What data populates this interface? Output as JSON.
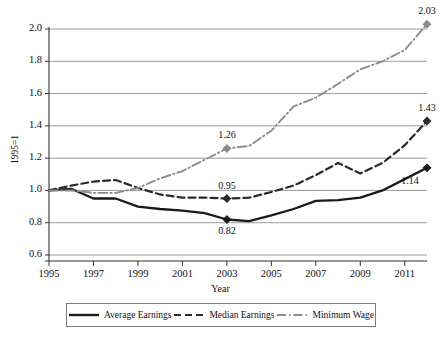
{
  "chart_data": {
    "type": "line",
    "title": "",
    "xlabel": "Year",
    "ylabel": "1995=1",
    "xlim": [
      1995,
      2012
    ],
    "ylim": [
      0.6,
      2.0
    ],
    "grid": true,
    "legend_position": "bottom",
    "x": [
      1995,
      1996,
      1997,
      1998,
      1999,
      2000,
      2001,
      2002,
      2003,
      2004,
      2005,
      2006,
      2007,
      2008,
      2009,
      2010,
      2011,
      2012
    ],
    "xtick_labels": [
      "1995",
      "1997",
      "1999",
      "2001",
      "2003",
      "2005",
      "2007",
      "2009",
      "2011"
    ],
    "xtick_values": [
      1995,
      1997,
      1999,
      2001,
      2003,
      2005,
      2007,
      2009,
      2011
    ],
    "ytick_labels": [
      "0.6",
      "0.8",
      "1.0",
      "1.2",
      "1.4",
      "1.6",
      "1.8",
      "2.0"
    ],
    "ytick_values": [
      0.6,
      0.8,
      1.0,
      1.2,
      1.4,
      1.6,
      1.8,
      2.0
    ],
    "series": [
      {
        "name": "Average Earnings",
        "style": "solid",
        "color": "#1a1a1a",
        "values": [
          1.0,
          1.01,
          0.95,
          0.95,
          0.9,
          0.885,
          0.875,
          0.86,
          0.82,
          0.81,
          0.845,
          0.885,
          0.935,
          0.94,
          0.955,
          1.0,
          1.07,
          1.14
        ]
      },
      {
        "name": "Median Earnings",
        "style": "dashed",
        "color": "#2b2b2b",
        "values": [
          1.0,
          1.03,
          1.055,
          1.065,
          1.015,
          0.975,
          0.955,
          0.955,
          0.95,
          0.955,
          0.99,
          1.03,
          1.095,
          1.17,
          1.105,
          1.17,
          1.28,
          1.43
        ]
      },
      {
        "name": "Minimum Wage",
        "style": "dashdot",
        "color": "#8c8c8c",
        "values": [
          1.0,
          1.0,
          0.985,
          0.985,
          1.015,
          1.075,
          1.12,
          1.19,
          1.26,
          1.275,
          1.37,
          1.52,
          1.575,
          1.66,
          1.75,
          1.8,
          1.87,
          2.03
        ]
      }
    ],
    "point_labels": [
      {
        "series": "Minimum Wage",
        "x": 2003,
        "y": 1.26,
        "text": "1.26",
        "placement": "above"
      },
      {
        "series": "Median Earnings",
        "x": 2003,
        "y": 0.95,
        "text": "0.95",
        "placement": "above"
      },
      {
        "series": "Average Earnings",
        "x": 2003,
        "y": 0.82,
        "text": "0.82",
        "placement": "below"
      },
      {
        "series": "Minimum Wage",
        "x": 2012,
        "y": 2.03,
        "text": "2.03",
        "placement": "above"
      },
      {
        "series": "Median Earnings",
        "x": 2012,
        "y": 1.43,
        "text": "1.43",
        "placement": "above"
      },
      {
        "series": "Average Earnings",
        "x": 2012,
        "y": 1.14,
        "text": "1.14",
        "placement": "below-left"
      }
    ]
  },
  "legend": {
    "entries": [
      {
        "label": "Average Earnings"
      },
      {
        "label": "Median Earnings"
      },
      {
        "label": "Minimum Wage"
      }
    ]
  }
}
